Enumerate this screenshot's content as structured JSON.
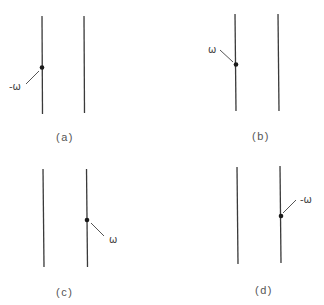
{
  "panels": [
    {
      "caption": "(a)",
      "label": "-ω"
    },
    {
      "caption": "(b)",
      "label": "ω"
    },
    {
      "caption": "(c)",
      "label": "ω"
    },
    {
      "caption": "(d)",
      "label": "-ω"
    }
  ]
}
